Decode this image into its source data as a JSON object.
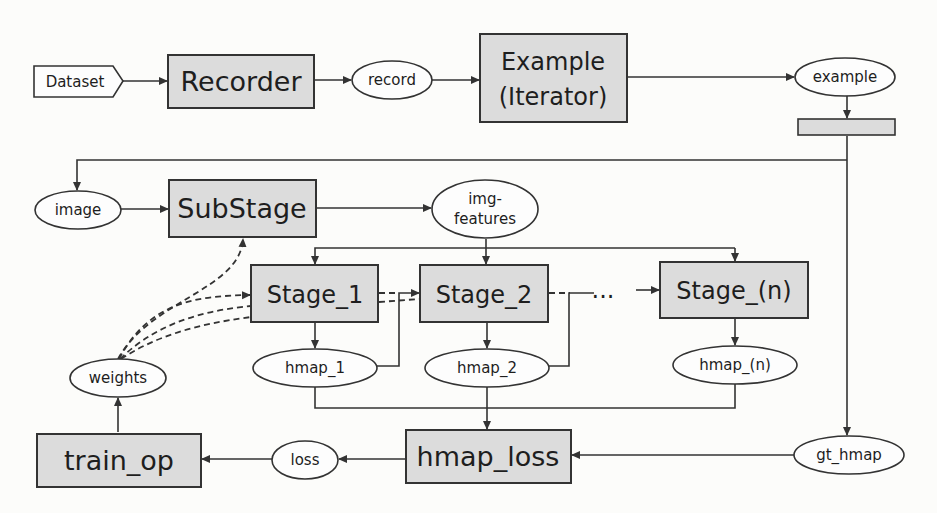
{
  "diagram": {
    "source": {
      "label": "Dataset"
    },
    "ops": {
      "recorder": "Recorder",
      "example_iterator_line1": "Example",
      "example_iterator_line2": "(Iterator)",
      "substage": "SubStage",
      "stage_1": "Stage_1",
      "stage_2": "Stage_2",
      "ellipsis": "...",
      "stage_n": "Stage_(n)",
      "hmap_loss": "hmap_loss",
      "train_op": "train_op",
      "splitter": ""
    },
    "tensors": {
      "record": "record",
      "example": "example",
      "image": "image",
      "img_features_line1": "img-",
      "img_features_line2": "features",
      "hmap_1": "hmap_1",
      "hmap_2": "hmap_2",
      "hmap_n": "hmap_(n)",
      "gt_hmap": "gt_hmap",
      "loss": "loss",
      "weights": "weights"
    },
    "edges": [
      {
        "from": "Dataset",
        "to": "Recorder",
        "style": "solid"
      },
      {
        "from": "Recorder",
        "to": "record",
        "style": "solid"
      },
      {
        "from": "record",
        "to": "Example (Iterator)",
        "style": "solid"
      },
      {
        "from": "Example (Iterator)",
        "to": "example",
        "style": "solid"
      },
      {
        "from": "example",
        "to": "splitter",
        "style": "solid"
      },
      {
        "from": "splitter",
        "to": "image",
        "style": "solid"
      },
      {
        "from": "splitter",
        "to": "gt_hmap",
        "style": "solid"
      },
      {
        "from": "image",
        "to": "SubStage",
        "style": "solid"
      },
      {
        "from": "SubStage",
        "to": "img-features",
        "style": "solid"
      },
      {
        "from": "img-features",
        "to": "Stage_1",
        "style": "solid"
      },
      {
        "from": "img-features",
        "to": "Stage_2",
        "style": "solid"
      },
      {
        "from": "img-features",
        "to": "Stage_(n)",
        "style": "solid"
      },
      {
        "from": "Stage_1",
        "to": "Stage_2",
        "style": "dashed"
      },
      {
        "from": "Stage_1",
        "to": "hmap_1",
        "style": "solid"
      },
      {
        "from": "hmap_1",
        "to": "Stage_2",
        "style": "solid"
      },
      {
        "from": "Stage_2",
        "to": "hmap_2",
        "style": "solid"
      },
      {
        "from": "hmap_2",
        "to": "Stage_(n)",
        "style": "solid"
      },
      {
        "from": "Stage_(n)",
        "to": "hmap_(n)",
        "style": "solid"
      },
      {
        "from": "hmap_1",
        "to": "hmap_loss",
        "style": "solid"
      },
      {
        "from": "hmap_2",
        "to": "hmap_loss",
        "style": "solid"
      },
      {
        "from": "hmap_(n)",
        "to": "hmap_loss",
        "style": "solid"
      },
      {
        "from": "gt_hmap",
        "to": "hmap_loss",
        "style": "solid"
      },
      {
        "from": "hmap_loss",
        "to": "loss",
        "style": "solid"
      },
      {
        "from": "loss",
        "to": "train_op",
        "style": "solid"
      },
      {
        "from": "train_op",
        "to": "weights",
        "style": "solid"
      },
      {
        "from": "weights",
        "to": "SubStage",
        "style": "dashed"
      },
      {
        "from": "weights",
        "to": "Stage_1",
        "style": "dashed"
      },
      {
        "from": "weights",
        "to": "Stage_2",
        "style": "dashed"
      }
    ]
  }
}
